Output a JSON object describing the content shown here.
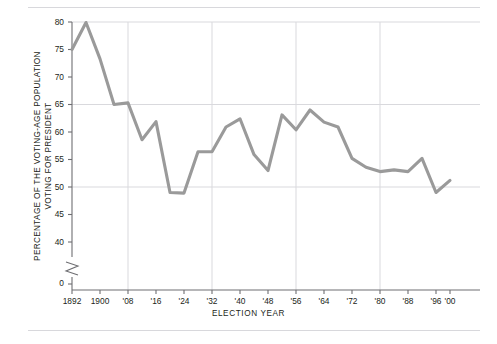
{
  "chart_data": {
    "type": "line",
    "title": "",
    "xlabel": "ELECTION  YEAR",
    "ylabel": "PERCENTAGE OF THE VOTING-AGE POPULATION VOTING FOR PRESIDENT",
    "ylabel_line1": "PERCENTAGE OF THE VOTING-AGE POPULATION",
    "ylabel_line2": "VOTING FOR PRESIDENT",
    "series_name": "Voter turnout",
    "line_color": "#9a9a9a",
    "grid_color": "#d9d9dd",
    "axis_color": "#6e6e72",
    "grid": true,
    "legend": "none",
    "ylim": [
      38,
      81
    ],
    "xlim": [
      1890,
      2002
    ],
    "y_axis_break": true,
    "y_break_label": "0",
    "ytick_labels": [
      "0",
      "40",
      "45",
      "50",
      "55",
      "60",
      "65",
      "70",
      "75",
      "80"
    ],
    "yticks": [
      40,
      45,
      50,
      55,
      60,
      65,
      70,
      75,
      80
    ],
    "y_gridlines": [
      50,
      65
    ],
    "xtick_labels": [
      "1892",
      "1900",
      "'08",
      "'16",
      "'24",
      "'32",
      "'40",
      "'48",
      "'56",
      "'64",
      "'72",
      "'80",
      "'88",
      "'96",
      "'00"
    ],
    "xticks": [
      1892,
      1900,
      1908,
      1916,
      1924,
      1932,
      1940,
      1948,
      1956,
      1964,
      1972,
      1980,
      1988,
      1996,
      2000
    ],
    "x_gridlines": [
      1908,
      1932,
      1956,
      1980
    ],
    "x": [
      1892,
      1896,
      1900,
      1904,
      1908,
      1912,
      1916,
      1920,
      1924,
      1928,
      1932,
      1936,
      1940,
      1944,
      1948,
      1952,
      1956,
      1960,
      1964,
      1968,
      1972,
      1976,
      1980,
      1984,
      1988,
      1992,
      1996,
      2000
    ],
    "values": [
      75.0,
      79.9,
      73.3,
      65.0,
      65.3,
      58.6,
      61.9,
      49.0,
      48.9,
      56.4,
      56.4,
      60.9,
      62.4,
      55.9,
      53.0,
      63.1,
      60.4,
      64.0,
      61.8,
      60.9,
      55.2,
      53.6,
      52.8,
      53.1,
      52.8,
      55.2,
      49.0,
      51.2
    ],
    "point_labels": []
  }
}
